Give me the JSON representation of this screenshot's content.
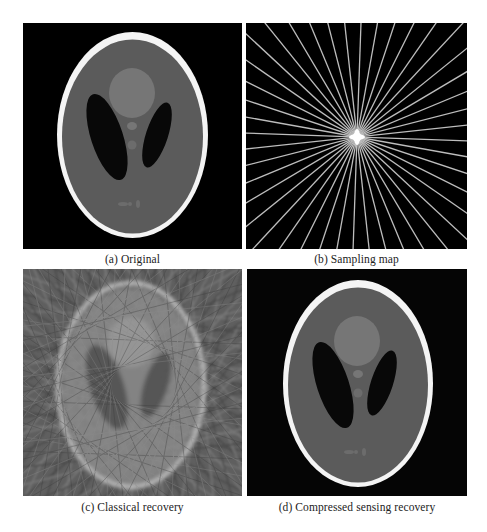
{
  "figure": {
    "panels": [
      {
        "id": "a",
        "caption": "(a) Original",
        "content": "Shepp-Logan phantom"
      },
      {
        "id": "b",
        "caption": "(b) Sampling map",
        "content": "radial k-space sampling lines"
      },
      {
        "id": "c",
        "caption": "(c) Classical recovery",
        "content": "phantom with streaking artifacts"
      },
      {
        "id": "d",
        "caption": "(d) Compressed sensing recovery",
        "content": "reconstructed Shepp-Logan phantom"
      }
    ]
  },
  "colors": {
    "background": "#000000",
    "skull": "#f4f4f4",
    "brain": "#5b5b5b",
    "light_region": "#767676",
    "dark_region": "#080808",
    "sampling_line": "#bdbdbd"
  },
  "sampling": {
    "radial_line_count": 22
  }
}
